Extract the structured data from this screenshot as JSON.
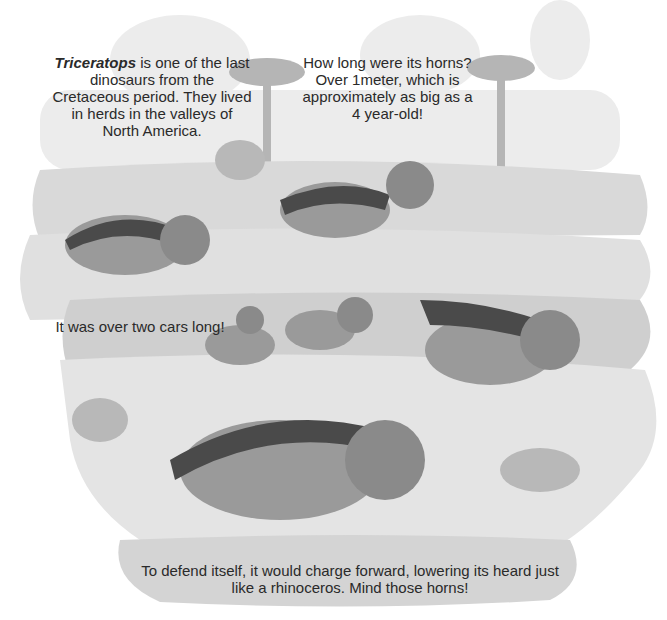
{
  "captions": {
    "intro_bold": "Triceratops",
    "intro_rest": " is one of the last dinosaurs from the Cretaceous period. They lived in herds in the valleys of North America.",
    "horns": "How long were its horns? Over 1meter, which is approximately as big as a 4 year-old!",
    "length": "It was over two cars long!",
    "defense": "To defend itself, it would charge forward, lowering its heard just like a rhinoceros. Mind those horns!"
  },
  "colors": {
    "background": "#ffffff",
    "ground_light": "#e2e2e2",
    "ground_mid": "#cfcfcf",
    "foliage": "#bdbdbd",
    "dino_body": "#9a9a9a",
    "dino_back": "#4a4a4a",
    "frill": "#8a8a8a",
    "text": "#2a2a2a"
  },
  "illustration": {
    "subject": "herd of triceratops in a prehistoric valley with palm trees and ferns",
    "dinosaur_count": 6
  }
}
